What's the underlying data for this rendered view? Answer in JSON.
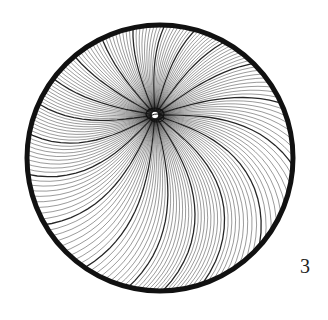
{
  "illustration": {
    "subject": "circular pen-and-ink vortex of fine curved lines radiating from an off-center knot",
    "frame_color": "#111111",
    "line_color": "#1a1a1a",
    "background": "#ffffff"
  },
  "page_number": "3"
}
